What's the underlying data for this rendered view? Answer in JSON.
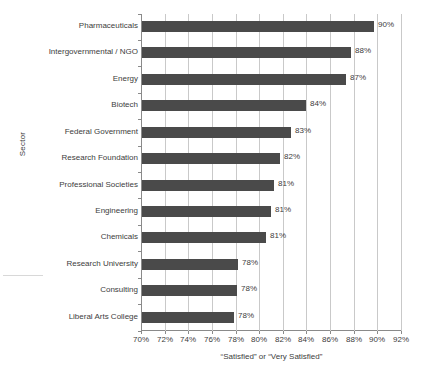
{
  "chart_data": {
    "type": "bar",
    "orientation": "horizontal",
    "title": "",
    "xlabel": "“Satisfied” or “Very Satisfied”",
    "ylabel": "Sector",
    "categories": [
      "Pharmaceuticals",
      "Intergovernmental / NGO",
      "Energy",
      "Biotech",
      "Federal Government",
      "Research Foundation",
      "Professional Societies",
      "Engineering",
      "Chemicals",
      "Research University",
      "Consulting",
      "Liberal Arts College"
    ],
    "values": [
      90,
      88,
      87,
      84,
      83,
      82,
      81,
      81,
      81,
      78,
      78,
      78
    ],
    "value_labels": [
      "90%",
      "88%",
      "87%",
      "84%",
      "83%",
      "82%",
      "81%",
      "81%",
      "81%",
      "78%",
      "78%",
      "78%"
    ],
    "bar_end_percent": [
      89.6,
      87.7,
      87.3,
      83.9,
      82.6,
      81.7,
      81.2,
      80.9,
      80.5,
      78.1,
      78.0,
      77.8
    ],
    "xlim": [
      70,
      92
    ],
    "xtick_values": [
      70,
      72,
      74,
      76,
      78,
      80,
      82,
      84,
      86,
      88,
      90,
      92
    ],
    "xtick_labels": [
      "70%",
      "72%",
      "74%",
      "76%",
      "78%",
      "80%",
      "82%",
      "84%",
      "86%",
      "88%",
      "90%",
      "92%"
    ],
    "grid": "vertical",
    "legend": "none",
    "bar_color": "#4a4a4a",
    "gridline_color": "#c9c9c9",
    "axis_color": "#8a8a8a"
  }
}
